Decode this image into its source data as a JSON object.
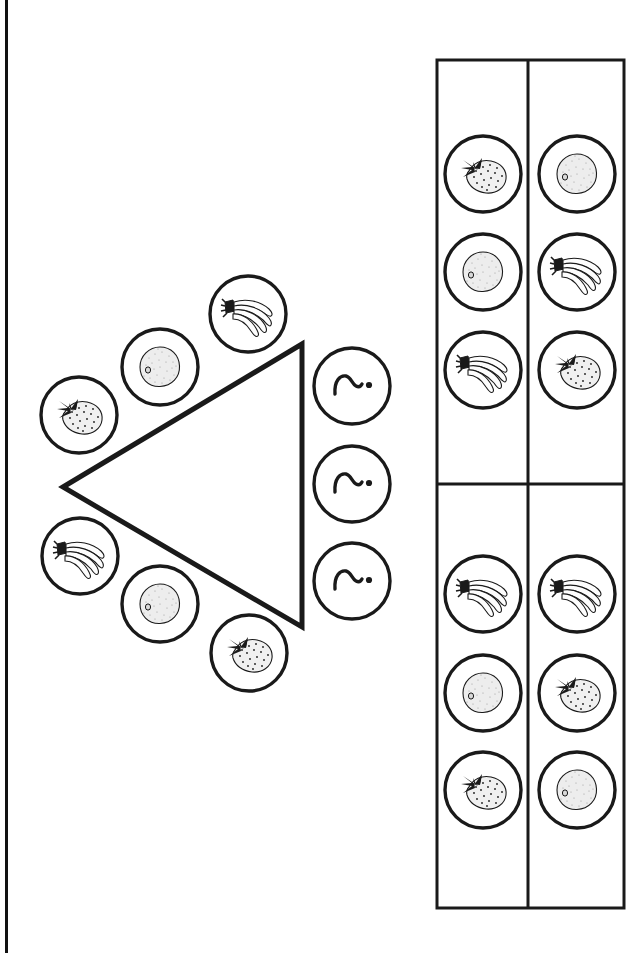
{
  "page": {
    "width": 643,
    "height": 953,
    "background_color": "#ffffff",
    "ink_color": "#1a1a1a",
    "scan_edge_color": "#111111"
  },
  "left_panel": {
    "name": "triangle-sorting-diagram",
    "shape": {
      "name": "left-pointing-triangle",
      "type": "triangle",
      "points": [
        [
          63,
          487
        ],
        [
          302,
          344
        ],
        [
          302,
          627
        ]
      ],
      "stroke_width": 5
    },
    "upper_arc_circles": [
      {
        "icon": "strawberry-icon",
        "label": "Strawberry",
        "cx": 79,
        "cy": 415,
        "r": 38
      },
      {
        "icon": "kiwi-icon",
        "label": "Kiwi",
        "cx": 160,
        "cy": 367,
        "r": 38
      },
      {
        "icon": "banana-icon",
        "label": "Bananas",
        "cx": 248,
        "cy": 314,
        "r": 38
      }
    ],
    "lower_arc_circles": [
      {
        "icon": "banana-icon",
        "label": "Bananas",
        "cx": 80,
        "cy": 556,
        "r": 38
      },
      {
        "icon": "kiwi-icon",
        "label": "Kiwi",
        "cx": 160,
        "cy": 604,
        "r": 38
      },
      {
        "icon": "strawberry-icon",
        "label": "Strawberry",
        "cx": 249,
        "cy": 653,
        "r": 38
      }
    ],
    "right_column_circles": [
      {
        "icon": "squiggle-dot-icon",
        "label": "~.",
        "cx": 352,
        "cy": 386,
        "r": 38
      },
      {
        "icon": "squiggle-dot-icon",
        "label": "~.",
        "cx": 352,
        "cy": 484,
        "r": 38
      },
      {
        "icon": "squiggle-dot-icon",
        "label": "~.",
        "cx": 352,
        "cy": 581,
        "r": 38
      }
    ]
  },
  "right_panel": {
    "name": "fruit-grid-table",
    "table": {
      "x": 437,
      "y": 60,
      "width": 187,
      "height": 848,
      "column_divider_x": 528,
      "row_divider_y": 484,
      "stroke_width": 3,
      "columns": 2,
      "groups": 2
    },
    "top_group": {
      "name": "top-group",
      "rows": [
        [
          {
            "icon": "strawberry-icon",
            "label": "Strawberry",
            "cx": 483,
            "cy": 174,
            "r": 38
          },
          {
            "icon": "kiwi-icon",
            "label": "Kiwi",
            "cx": 577,
            "cy": 174,
            "r": 38
          }
        ],
        [
          {
            "icon": "kiwi-icon",
            "label": "Kiwi",
            "cx": 483,
            "cy": 272,
            "r": 38
          },
          {
            "icon": "banana-icon",
            "label": "Bananas",
            "cx": 577,
            "cy": 272,
            "r": 38
          }
        ],
        [
          {
            "icon": "banana-icon",
            "label": "Bananas",
            "cx": 483,
            "cy": 370,
            "r": 38
          },
          {
            "icon": "strawberry-icon",
            "label": "Strawberry",
            "cx": 577,
            "cy": 370,
            "r": 38
          }
        ]
      ]
    },
    "bottom_group": {
      "name": "bottom-group",
      "rows": [
        [
          {
            "icon": "banana-icon",
            "label": "Bananas",
            "cx": 483,
            "cy": 594,
            "r": 38
          },
          {
            "icon": "banana-icon",
            "label": "Bananas",
            "cx": 577,
            "cy": 594,
            "r": 38
          }
        ],
        [
          {
            "icon": "kiwi-icon",
            "label": "Kiwi",
            "cx": 483,
            "cy": 693,
            "r": 38
          },
          {
            "icon": "strawberry-icon",
            "label": "Strawberry",
            "cx": 577,
            "cy": 693,
            "r": 38
          }
        ],
        [
          {
            "icon": "strawberry-icon",
            "label": "Strawberry",
            "cx": 483,
            "cy": 790,
            "r": 38
          },
          {
            "icon": "kiwi-icon",
            "label": "Kiwi",
            "cx": 577,
            "cy": 790,
            "r": 38
          }
        ]
      ]
    }
  }
}
